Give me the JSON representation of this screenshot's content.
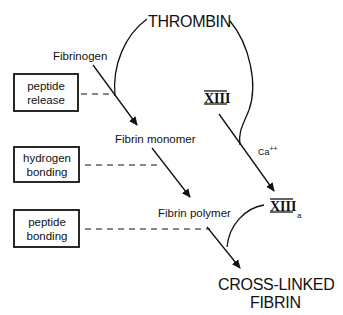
{
  "title": "THROMBIN",
  "nodes": {
    "fibrinogen": "Fibrinogen",
    "fibrin_monomer": "Fibrin monomer",
    "fibrin_polymer": "Fibrin polymer",
    "cross_linked_line1": "CROSS-LINKED",
    "cross_linked_line2": "FIBRIN",
    "factor_xiii": "XIII",
    "factor_xiiia": "XIII",
    "factor_xiiia_sub": "a",
    "calcium": "Ca",
    "calcium_sup": "++"
  },
  "process_boxes": [
    {
      "line1": "peptide",
      "line2": "release"
    },
    {
      "line1": "hydrogen",
      "line2": "bonding"
    },
    {
      "line1": "peptide",
      "line2": "bonding"
    }
  ]
}
